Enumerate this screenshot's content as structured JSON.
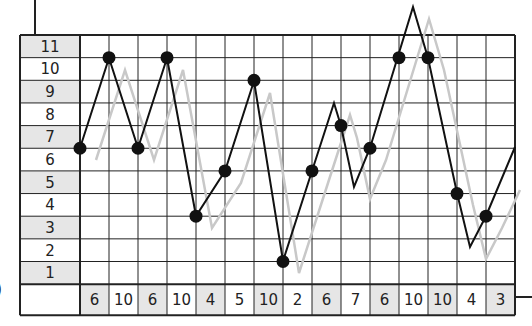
{
  "chart_data": {
    "type": "line",
    "title": "",
    "xlabel": "",
    "ylabel": "",
    "ylim": [
      1,
      11
    ],
    "y_ticks": [
      11,
      10,
      9,
      8,
      7,
      6,
      5,
      4,
      3,
      2,
      1
    ],
    "shaded_y_rows": [
      11,
      9,
      7,
      5,
      3,
      1
    ],
    "categories": [
      "6",
      "10",
      "6",
      "10",
      "4",
      "5",
      "10",
      "2",
      "6",
      "7",
      "6",
      "10",
      "10",
      "4",
      "3"
    ],
    "shaded_columns": [
      0,
      2,
      4,
      6,
      8,
      10,
      12,
      14
    ],
    "grid": true,
    "series": [
      {
        "name": "plotted points",
        "color": "#111111",
        "markers": true,
        "values": [
          6,
          10,
          6,
          10,
          3,
          5,
          9,
          1,
          5,
          7,
          6,
          10,
          10,
          4,
          3
        ]
      }
    ],
    "polyline_points": [
      [
        80,
        148
      ],
      [
        109,
        58
      ],
      [
        138,
        148
      ],
      [
        167,
        58
      ],
      [
        196,
        216
      ],
      [
        225,
        171
      ],
      [
        254,
        81
      ],
      [
        283,
        261
      ],
      [
        312,
        171
      ],
      [
        334,
        103
      ],
      [
        341,
        126
      ],
      [
        354,
        187
      ],
      [
        370,
        148
      ],
      [
        413,
        7
      ],
      [
        428,
        58
      ],
      [
        457,
        193
      ],
      [
        470,
        247
      ],
      [
        486,
        216
      ],
      [
        515,
        147
      ]
    ],
    "ghost_points": [
      [
        96,
        160
      ],
      [
        125,
        70
      ],
      [
        154,
        160
      ],
      [
        183,
        70
      ],
      [
        212,
        228
      ],
      [
        241,
        183
      ],
      [
        270,
        93
      ],
      [
        299,
        273
      ],
      [
        328,
        183
      ],
      [
        350,
        115
      ],
      [
        357,
        138
      ],
      [
        370,
        199
      ],
      [
        386,
        160
      ],
      [
        429,
        19
      ],
      [
        444,
        70
      ],
      [
        473,
        205
      ],
      [
        486,
        259
      ],
      [
        502,
        228
      ],
      [
        520,
        190
      ]
    ],
    "ghost_color": "#c8c8c8",
    "shade_color": "#e6e6e6"
  },
  "edge_glyph": ")"
}
